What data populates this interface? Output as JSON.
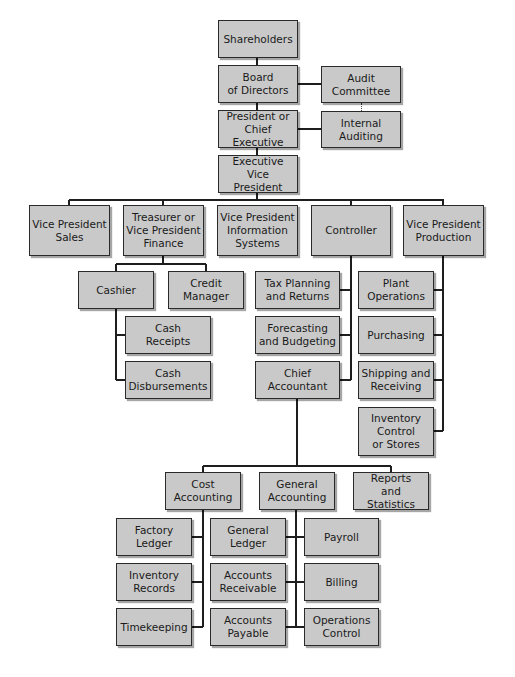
{
  "colors": {
    "box_fill": "#c9c9c9",
    "box_border": "#2a2a2a",
    "line": "#1e1e1e"
  },
  "nodes": [
    {
      "id": "shareholders",
      "label": "Shareholders",
      "x": 218,
      "y": 20,
      "w": 80,
      "h": 38
    },
    {
      "id": "board",
      "label": "Board\nof Directors",
      "x": 218,
      "y": 65,
      "w": 80,
      "h": 38
    },
    {
      "id": "audit",
      "label": "Audit\nCommittee",
      "x": 321,
      "y": 66,
      "w": 80,
      "h": 37
    },
    {
      "id": "president",
      "label": "President or\nChief Executive",
      "x": 218,
      "y": 110,
      "w": 80,
      "h": 38
    },
    {
      "id": "internal_audit",
      "label": "Internal\nAuditing",
      "x": 321,
      "y": 111,
      "w": 80,
      "h": 37
    },
    {
      "id": "evp",
      "label": "Executive\nVice President",
      "x": 218,
      "y": 155,
      "w": 80,
      "h": 38
    },
    {
      "id": "vp_sales",
      "label": "Vice President\nSales",
      "x": 29,
      "y": 205,
      "w": 81,
      "h": 51
    },
    {
      "id": "treasurer",
      "label": "Treasurer or\nVice President\nFinance",
      "x": 123,
      "y": 205,
      "w": 81,
      "h": 51
    },
    {
      "id": "vp_is",
      "label": "Vice President\nInformation\nSystems",
      "x": 217,
      "y": 205,
      "w": 81,
      "h": 51
    },
    {
      "id": "controller",
      "label": "Controller",
      "x": 311,
      "y": 205,
      "w": 80,
      "h": 51
    },
    {
      "id": "vp_prod",
      "label": "Vice President\nProduction",
      "x": 403,
      "y": 205,
      "w": 81,
      "h": 51
    },
    {
      "id": "cashier",
      "label": "Cashier",
      "x": 78,
      "y": 271,
      "w": 76,
      "h": 38
    },
    {
      "id": "credit",
      "label": "Credit\nManager",
      "x": 168,
      "y": 271,
      "w": 76,
      "h": 38
    },
    {
      "id": "cash_receipts",
      "label": "Cash\nReceipts",
      "x": 125,
      "y": 316,
      "w": 86,
      "h": 38
    },
    {
      "id": "cash_disb",
      "label": "Cash\nDisbursements",
      "x": 125,
      "y": 361,
      "w": 86,
      "h": 38
    },
    {
      "id": "tax",
      "label": "Tax Planning\nand Returns",
      "x": 255,
      "y": 271,
      "w": 85,
      "h": 38
    },
    {
      "id": "forecast",
      "label": "Forecasting\nand Budgeting",
      "x": 255,
      "y": 316,
      "w": 85,
      "h": 38
    },
    {
      "id": "chief_acct",
      "label": "Chief\nAccountant",
      "x": 255,
      "y": 361,
      "w": 85,
      "h": 38
    },
    {
      "id": "plant",
      "label": "Plant\nOperations",
      "x": 358,
      "y": 271,
      "w": 76,
      "h": 38
    },
    {
      "id": "purchasing",
      "label": "Purchasing",
      "x": 358,
      "y": 316,
      "w": 76,
      "h": 38
    },
    {
      "id": "shipping",
      "label": "Shipping and\nReceiving",
      "x": 358,
      "y": 361,
      "w": 76,
      "h": 38
    },
    {
      "id": "inventory_ctrl",
      "label": "Inventory\nControl\nor Stores",
      "x": 358,
      "y": 407,
      "w": 76,
      "h": 49
    },
    {
      "id": "cost_acct",
      "label": "Cost\nAccounting",
      "x": 165,
      "y": 472,
      "w": 76,
      "h": 38
    },
    {
      "id": "gen_acct",
      "label": "General\nAccounting",
      "x": 259,
      "y": 472,
      "w": 76,
      "h": 38
    },
    {
      "id": "reports",
      "label": "Reports\nand Statistics",
      "x": 353,
      "y": 472,
      "w": 76,
      "h": 38
    },
    {
      "id": "factory",
      "label": "Factory\nLedger",
      "x": 116,
      "y": 518,
      "w": 76,
      "h": 38
    },
    {
      "id": "inv_records",
      "label": "Inventory\nRecords",
      "x": 116,
      "y": 563,
      "w": 76,
      "h": 38
    },
    {
      "id": "timekeeping",
      "label": "Timekeeping",
      "x": 116,
      "y": 608,
      "w": 76,
      "h": 38
    },
    {
      "id": "gen_ledger",
      "label": "General\nLedger",
      "x": 210,
      "y": 518,
      "w": 76,
      "h": 38
    },
    {
      "id": "ar",
      "label": "Accounts\nReceivable",
      "x": 210,
      "y": 563,
      "w": 76,
      "h": 38
    },
    {
      "id": "ap",
      "label": "Accounts\nPayable",
      "x": 210,
      "y": 608,
      "w": 76,
      "h": 38
    },
    {
      "id": "payroll",
      "label": "Payroll",
      "x": 304,
      "y": 518,
      "w": 75,
      "h": 38
    },
    {
      "id": "billing",
      "label": "Billing",
      "x": 304,
      "y": 563,
      "w": 75,
      "h": 38
    },
    {
      "id": "ops_control",
      "label": "Operations\nControl",
      "x": 304,
      "y": 608,
      "w": 75,
      "h": 38
    }
  ],
  "lines": [
    [
      257,
      58,
      257,
      200
    ],
    [
      298,
      84,
      321,
      84
    ],
    [
      298,
      129,
      321,
      129
    ],
    [
      69,
      200,
      444,
      200
    ],
    [
      69,
      200,
      69,
      205
    ],
    [
      163,
      200,
      163,
      205
    ],
    [
      351,
      200,
      351,
      205
    ],
    [
      443,
      200,
      443,
      205
    ],
    [
      163,
      256,
      163,
      264
    ],
    [
      116,
      264,
      206,
      264
    ],
    [
      116,
      264,
      116,
      271
    ],
    [
      206,
      264,
      206,
      271
    ],
    [
      116,
      309,
      116,
      380
    ],
    [
      116,
      335,
      125,
      335
    ],
    [
      116,
      380,
      125,
      380
    ],
    [
      351,
      256,
      351,
      380
    ],
    [
      340,
      290,
      351,
      290
    ],
    [
      340,
      335,
      351,
      335
    ],
    [
      340,
      380,
      351,
      380
    ],
    [
      443,
      256,
      443,
      431
    ],
    [
      434,
      290,
      443,
      290
    ],
    [
      434,
      335,
      443,
      335
    ],
    [
      434,
      380,
      443,
      380
    ],
    [
      434,
      431,
      443,
      431
    ],
    [
      297,
      399,
      297,
      466
    ],
    [
      203,
      466,
      391,
      466
    ],
    [
      203,
      466,
      203,
      472
    ],
    [
      391,
      466,
      391,
      472
    ],
    [
      203,
      510,
      203,
      627
    ],
    [
      192,
      537,
      203,
      537
    ],
    [
      192,
      582,
      203,
      582
    ],
    [
      192,
      627,
      203,
      627
    ],
    [
      296,
      510,
      296,
      627
    ],
    [
      286,
      537,
      304,
      537
    ],
    [
      286,
      582,
      304,
      582
    ],
    [
      286,
      627,
      304,
      627
    ]
  ],
  "dotted_lines": [
    [
      361,
      103,
      361,
      111
    ]
  ]
}
